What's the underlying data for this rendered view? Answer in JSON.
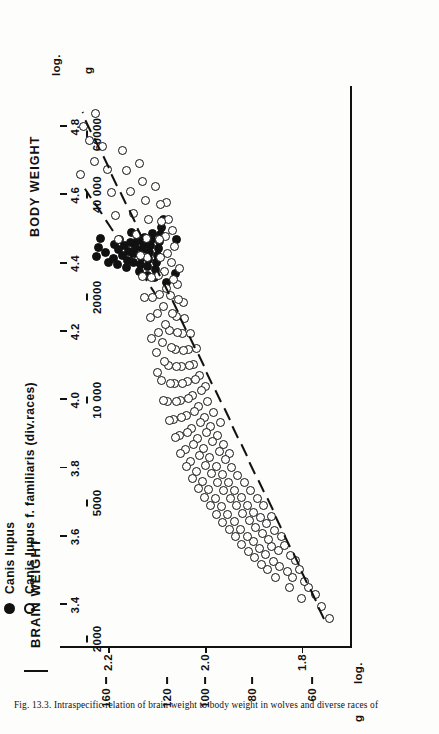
{
  "figure": {
    "caption": "Fig. 13.3. Intraspecific relation of brain weight to body weight in wolves and diverse races of"
  },
  "yaxis_title": "BRAIN WEIGHT",
  "xaxis_title": "BODY WEIGHT",
  "yaxis_unit_log": "log.",
  "yaxis_unit_g": "g",
  "xaxis_unit_log": "log.",
  "xaxis_unit_g": "g",
  "legend": {
    "items": [
      {
        "marker": "filled-circle",
        "label": "Canis lupus"
      },
      {
        "marker": "open-circle",
        "label": "Canis lupus f. familiaris (div.races)"
      }
    ]
  },
  "chart_data": {
    "type": "scatter",
    "xlabel": "BODY WEIGHT",
    "ylabel": "BRAIN WEIGHT",
    "grid": false,
    "legend_position": "top-left",
    "x_scale": "log10",
    "y_scale": "log10",
    "xlim": [
      3.28,
      4.92
    ],
    "ylim": [
      1.7,
      2.3
    ],
    "x_ticks_log": [
      3.4,
      3.6,
      3.8,
      4.0,
      4.2,
      4.4,
      4.6,
      4.8
    ],
    "x_ticklabels_log": [
      "3.4",
      "3.6",
      "3.8",
      "4.0",
      "4.2",
      "4.4",
      "4.6",
      "4.8"
    ],
    "x_ticks_g_values": [
      2000,
      5000,
      10000,
      20000,
      40000,
      60000
    ],
    "x_ticklabels_g": [
      "2000",
      "5000",
      "10 000",
      "20000",
      "40 000",
      "60000"
    ],
    "y_ticks_log": [
      1.8,
      2.0,
      2.2
    ],
    "y_ticklabels_log": [
      "1.8",
      "2.0",
      "2.2"
    ],
    "y_ticks_g_values": [
      60,
      80,
      100,
      120,
      160
    ],
    "y_ticklabels_g": [
      "60",
      "80",
      "100",
      "120",
      "160"
    ],
    "series": [
      {
        "name": "Canis lupus",
        "marker": "filled-circle",
        "color": "#111111",
        "n_points": 46,
        "regression_line": {
          "x": [
            4.3,
            4.62
          ],
          "y": [
            2.1,
            2.25
          ]
        },
        "points": [
          [
            4.42,
            2.225
          ],
          [
            4.447,
            2.22
          ],
          [
            4.474,
            2.216
          ],
          [
            4.432,
            2.205
          ],
          [
            4.404,
            2.199
          ],
          [
            4.416,
            2.19
          ],
          [
            4.455,
            2.188
          ],
          [
            4.398,
            2.182
          ],
          [
            4.44,
            2.178
          ],
          [
            4.47,
            2.176
          ],
          [
            4.424,
            2.17
          ],
          [
            4.452,
            2.167
          ],
          [
            4.388,
            2.163
          ],
          [
            4.41,
            2.16
          ],
          [
            4.436,
            2.158
          ],
          [
            4.462,
            2.155
          ],
          [
            4.492,
            2.152
          ],
          [
            4.402,
            2.148
          ],
          [
            4.428,
            2.145
          ],
          [
            4.448,
            2.143
          ],
          [
            4.468,
            2.14
          ],
          [
            4.378,
            2.136
          ],
          [
            4.396,
            2.133
          ],
          [
            4.418,
            2.131
          ],
          [
            4.44,
            2.129
          ],
          [
            4.458,
            2.127
          ],
          [
            4.476,
            2.125
          ],
          [
            4.366,
            2.12
          ],
          [
            4.39,
            2.118
          ],
          [
            4.412,
            2.116
          ],
          [
            4.432,
            2.114
          ],
          [
            4.452,
            2.112
          ],
          [
            4.47,
            2.11
          ],
          [
            4.488,
            2.108
          ],
          [
            4.358,
            2.104
          ],
          [
            4.382,
            2.102
          ],
          [
            4.404,
            2.1
          ],
          [
            4.424,
            2.098
          ],
          [
            4.444,
            2.096
          ],
          [
            4.464,
            2.094
          ],
          [
            4.484,
            2.092
          ],
          [
            4.506,
            2.09
          ],
          [
            4.53,
            2.086
          ],
          [
            4.344,
            2.08
          ],
          [
            4.37,
            2.062
          ],
          [
            4.47,
            2.058
          ]
        ]
      },
      {
        "name": "Canis lupus f. familiaris (div.races)",
        "marker": "open-circle",
        "color": "#111111",
        "n_points": 188,
        "regression_line": {
          "x": [
            3.36,
            4.84
          ],
          "y": [
            1.755,
            2.255
          ]
        },
        "points": [
          [
            3.36,
            1.742
          ],
          [
            3.395,
            1.76
          ],
          [
            3.43,
            1.772
          ],
          [
            3.452,
            1.785
          ],
          [
            3.418,
            1.8
          ],
          [
            3.47,
            1.795
          ],
          [
            3.505,
            1.805
          ],
          [
            3.482,
            1.818
          ],
          [
            3.53,
            1.812
          ],
          [
            3.452,
            1.826
          ],
          [
            3.498,
            1.83
          ],
          [
            3.545,
            1.824
          ],
          [
            3.575,
            1.835
          ],
          [
            3.512,
            1.845
          ],
          [
            3.56,
            1.848
          ],
          [
            3.6,
            1.842
          ],
          [
            3.48,
            1.855
          ],
          [
            3.528,
            1.858
          ],
          [
            3.572,
            1.862
          ],
          [
            3.618,
            1.856
          ],
          [
            3.505,
            1.87
          ],
          [
            3.548,
            1.874
          ],
          [
            3.592,
            1.868
          ],
          [
            3.64,
            1.872
          ],
          [
            3.66,
            1.862
          ],
          [
            3.52,
            1.884
          ],
          [
            3.566,
            1.888
          ],
          [
            3.61,
            1.882
          ],
          [
            3.655,
            1.886
          ],
          [
            3.69,
            1.878
          ],
          [
            3.54,
            1.898
          ],
          [
            3.585,
            1.9
          ],
          [
            3.628,
            1.895
          ],
          [
            3.672,
            1.899
          ],
          [
            3.712,
            1.892
          ],
          [
            3.558,
            1.91
          ],
          [
            3.602,
            1.913
          ],
          [
            3.648,
            1.908
          ],
          [
            3.692,
            1.912
          ],
          [
            3.735,
            1.906
          ],
          [
            3.578,
            1.924
          ],
          [
            3.622,
            1.927
          ],
          [
            3.668,
            1.922
          ],
          [
            3.715,
            1.925
          ],
          [
            3.758,
            1.919
          ],
          [
            3.6,
            1.937
          ],
          [
            3.645,
            1.94
          ],
          [
            3.69,
            1.935
          ],
          [
            3.736,
            1.938
          ],
          [
            3.78,
            1.932
          ],
          [
            3.62,
            1.95
          ],
          [
            3.666,
            1.953
          ],
          [
            3.712,
            1.948
          ],
          [
            3.758,
            1.951
          ],
          [
            3.802,
            1.945
          ],
          [
            3.845,
            1.95
          ],
          [
            3.642,
            1.963
          ],
          [
            3.688,
            1.966
          ],
          [
            3.735,
            1.961
          ],
          [
            3.782,
            1.964
          ],
          [
            3.826,
            1.958
          ],
          [
            3.87,
            1.962
          ],
          [
            3.665,
            1.976
          ],
          [
            3.712,
            1.979
          ],
          [
            3.758,
            1.974
          ],
          [
            3.805,
            1.977
          ],
          [
            3.85,
            1.971
          ],
          [
            3.895,
            1.975
          ],
          [
            3.935,
            1.968
          ],
          [
            3.69,
            1.989
          ],
          [
            3.738,
            1.992
          ],
          [
            3.785,
            1.987
          ],
          [
            3.832,
            1.99
          ],
          [
            3.878,
            1.984
          ],
          [
            3.922,
            1.988
          ],
          [
            3.965,
            1.982
          ],
          [
            3.715,
            2.002
          ],
          [
            3.762,
            2.005
          ],
          [
            3.81,
            2.0
          ],
          [
            3.858,
            2.003
          ],
          [
            3.905,
            1.997
          ],
          [
            3.95,
            2.001
          ],
          [
            3.995,
            1.995
          ],
          [
            4.04,
            1.999
          ],
          [
            3.742,
            2.014
          ],
          [
            3.79,
            2.017
          ],
          [
            3.838,
            2.012
          ],
          [
            3.888,
            2.015
          ],
          [
            3.935,
            2.01
          ],
          [
            3.982,
            2.013
          ],
          [
            4.028,
            2.007
          ],
          [
            4.072,
            2.011
          ],
          [
            3.77,
            2.026
          ],
          [
            3.82,
            2.029
          ],
          [
            3.87,
            2.024
          ],
          [
            3.918,
            2.027
          ],
          [
            3.966,
            2.022
          ],
          [
            4.014,
            2.025
          ],
          [
            4.06,
            2.019
          ],
          [
            4.105,
            2.023
          ],
          [
            4.15,
            2.017
          ],
          [
            3.805,
            2.038
          ],
          [
            3.856,
            2.041
          ],
          [
            3.906,
            2.036
          ],
          [
            3.956,
            2.039
          ],
          [
            4.006,
            2.034
          ],
          [
            4.054,
            2.037
          ],
          [
            4.102,
            2.032
          ],
          [
            4.148,
            2.035
          ],
          [
            4.195,
            2.03
          ],
          [
            3.845,
            2.05
          ],
          [
            3.896,
            2.053
          ],
          [
            3.948,
            2.048
          ],
          [
            3.998,
            2.051
          ],
          [
            4.048,
            2.046
          ],
          [
            4.098,
            2.049
          ],
          [
            4.146,
            2.044
          ],
          [
            4.194,
            2.047
          ],
          [
            4.24,
            2.042
          ],
          [
            4.285,
            2.045
          ],
          [
            3.89,
            2.062
          ],
          [
            3.944,
            2.065
          ],
          [
            3.996,
            2.06
          ],
          [
            4.048,
            2.063
          ],
          [
            4.098,
            2.058
          ],
          [
            4.148,
            2.061
          ],
          [
            4.198,
            2.056
          ],
          [
            4.246,
            2.059
          ],
          [
            4.294,
            2.054
          ],
          [
            4.34,
            2.057
          ],
          [
            4.385,
            2.052
          ],
          [
            3.94,
            2.074
          ],
          [
            3.996,
            2.077
          ],
          [
            4.05,
            2.072
          ],
          [
            4.102,
            2.075
          ],
          [
            4.154,
            2.07
          ],
          [
            4.205,
            2.073
          ],
          [
            4.255,
            2.068
          ],
          [
            4.305,
            2.071
          ],
          [
            4.354,
            2.066
          ],
          [
            4.402,
            2.069
          ],
          [
            4.45,
            2.064
          ],
          [
            4.498,
            2.067
          ],
          [
            4.0,
            2.086
          ],
          [
            4.058,
            2.089
          ],
          [
            4.114,
            2.084
          ],
          [
            4.168,
            2.087
          ],
          [
            4.222,
            2.082
          ],
          [
            4.275,
            2.085
          ],
          [
            4.327,
            2.08
          ],
          [
            4.378,
            2.083
          ],
          [
            4.428,
            2.078
          ],
          [
            4.478,
            2.081
          ],
          [
            4.528,
            2.076
          ],
          [
            4.578,
            2.079
          ],
          [
            4.08,
            2.098
          ],
          [
            4.14,
            2.101
          ],
          [
            4.198,
            2.096
          ],
          [
            4.255,
            2.099
          ],
          [
            4.31,
            2.094
          ],
          [
            4.365,
            2.097
          ],
          [
            4.418,
            2.092
          ],
          [
            4.47,
            2.095
          ],
          [
            4.522,
            2.09
          ],
          [
            4.574,
            2.093
          ],
          [
            4.626,
            2.103
          ],
          [
            4.18,
            2.11
          ],
          [
            4.242,
            2.113
          ],
          [
            4.302,
            2.108
          ],
          [
            4.36,
            2.111
          ],
          [
            4.418,
            2.118
          ],
          [
            4.474,
            2.121
          ],
          [
            4.53,
            2.116
          ],
          [
            4.586,
            2.124
          ],
          [
            4.64,
            2.13
          ],
          [
            4.694,
            2.136
          ],
          [
            4.3,
            2.126
          ],
          [
            4.362,
            2.129
          ],
          [
            4.424,
            2.134
          ],
          [
            4.486,
            2.142
          ],
          [
            4.548,
            2.148
          ],
          [
            4.61,
            2.155
          ],
          [
            4.672,
            2.162
          ],
          [
            4.732,
            2.17
          ],
          [
            4.47,
            2.178
          ],
          [
            4.54,
            2.186
          ],
          [
            4.608,
            2.194
          ],
          [
            4.676,
            2.202
          ],
          [
            4.742,
            2.212
          ],
          [
            4.7,
            2.228
          ],
          [
            4.76,
            2.24
          ],
          [
            4.8,
            2.252
          ],
          [
            4.66,
            2.258
          ],
          [
            4.838,
            2.226
          ]
        ]
      }
    ]
  }
}
